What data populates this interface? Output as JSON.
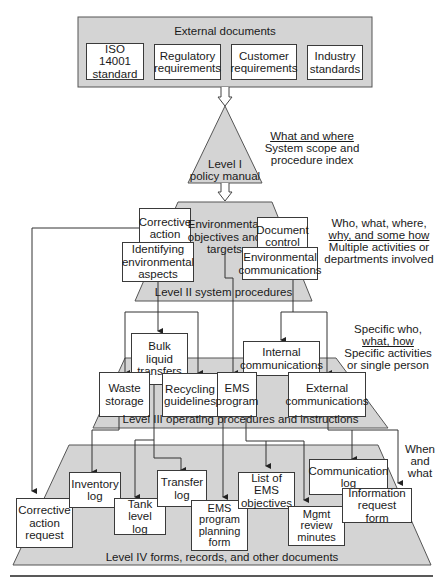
{
  "external_documents": {
    "title": "External documents",
    "items": [
      "ISO 14001\nstandard",
      "Regulatory\nrequirements",
      "Customer\nrequirements",
      "Industry\nstandards"
    ]
  },
  "level1": {
    "label_line1": "Level I",
    "label_line2": "policy manual",
    "note_heading": "What and where",
    "note_line1": "System scope and",
    "note_line2": "procedure index"
  },
  "level2": {
    "label": "Level II system procedures",
    "boxes": {
      "corrective_action": "Corrective\naction",
      "env_objectives": "Environmental\nobjectives and\ntargets",
      "document_control": "Document\ncontrol",
      "identifying_aspects": "Identifying\nenvironmental\naspects",
      "env_communications": "Environmental\ncommunications"
    },
    "note_line1": "Who, what, where,",
    "note_heading": "why, and some how",
    "note_line2": "Multiple activities or",
    "note_line3": "departments involved"
  },
  "level3": {
    "label": "Level III operating procedures and instructions",
    "boxes": {
      "bulk_liquid": "Bulk\nliquid\ntransfers",
      "internal_comms": "Internal\ncommunications",
      "waste_storage": "Waste\nstorage",
      "recycling": "Recycling\nguidelines",
      "ems_program": "EMS\nprogram",
      "external_comms": "External\ncommunications"
    },
    "note_line1": "Specific who,",
    "note_heading": "what, how",
    "note_line2": "Specific activities",
    "note_line3": "or single person"
  },
  "level4": {
    "label": "Level IV forms, records, and other documents",
    "boxes": {
      "corrective_request": "Corrective\naction\nrequest",
      "inventory_log": "Inventory\nlog",
      "tank_level_log": "Tank level\nlog",
      "transfer_log": "Transfer\nlog",
      "ems_planning_form": "EMS\nprogram\nplanning\nform",
      "list_ems_objectives": "List of EMS\nobjectives",
      "communication_log": "Communication\nlog",
      "mgmt_review": "Mgmt\nreview\nminutes",
      "info_request_form": "Information\nrequest form"
    },
    "note_line1": "When",
    "note_line2": "and",
    "note_line3": "what"
  }
}
